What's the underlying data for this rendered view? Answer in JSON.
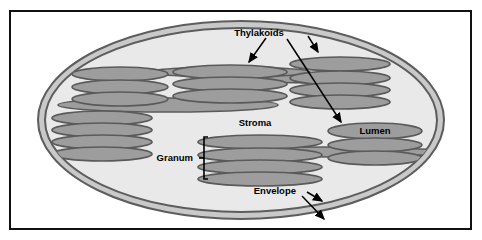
{
  "figure": {
    "frame": {
      "border_color": "#111111",
      "background": "#ffffff"
    },
    "colors": {
      "envelope_outer_line": "#5d5d5d",
      "envelope_band": "#c9c9c9",
      "stroma_fill": "#e9e9e9",
      "thylakoid_fill": "#9d9d9d",
      "thylakoid_outline": "#5a5a5a",
      "lamella_fill": "#9d9d9d",
      "label_color": "#000000",
      "arrow_color": "#000000"
    },
    "labels": [
      {
        "id": "thylakoids",
        "text": "Thylakoids",
        "x": 259,
        "y": 32
      },
      {
        "id": "stroma",
        "text": "Stroma",
        "x": 243,
        "y": 126
      },
      {
        "id": "lumen",
        "text": "Lumen",
        "x": 358,
        "y": 133
      },
      {
        "id": "granum",
        "text": "Granum",
        "x": 164,
        "y": 163
      },
      {
        "id": "envelope",
        "text": "Envelope",
        "x": 267,
        "y": 194
      }
    ],
    "annotations": {
      "thylakoid_arrow_left": "arrow-pointing-down-left-to-lamella",
      "thylakoid_arrow_right": "arrow-pointing-down-right-to-upper-right-stack",
      "thylakoid_arrow_long": "long-diagonal-arrow-to-lumen-disc",
      "granum_bracket": "curly-bracket-spanning-four-stacked-discs",
      "envelope_arrow_upper": "arrow-pointing-to-inner-membrane",
      "envelope_arrow_lower": "arrow-pointing-to-outer-membrane"
    },
    "structures": {
      "envelope": {
        "name": "double-membrane-envelope",
        "membranes": 2
      },
      "stroma": {
        "name": "stroma-interior"
      },
      "grana": [
        {
          "id": "granum-left-upper",
          "discs": 3
        },
        {
          "id": "granum-left-lower",
          "discs": 5
        },
        {
          "id": "granum-mid-upper",
          "discs": 4
        },
        {
          "id": "granum-mid-lower",
          "discs": 4
        },
        {
          "id": "granum-right-upper",
          "discs": 4
        },
        {
          "id": "granum-right-lower",
          "discs": 4
        }
      ],
      "lamellae": [
        {
          "id": "lamella-upper",
          "description": "long-stroma-thylakoid-connecting-left-and-mid-grana"
        },
        {
          "id": "lamella-mid",
          "description": "stroma-thylakoid-between-mid-and-right-upper-grana"
        },
        {
          "id": "lamella-lower",
          "description": "stroma-thylakoid-between-mid-lower-and-right-lower-grana"
        }
      ]
    }
  }
}
